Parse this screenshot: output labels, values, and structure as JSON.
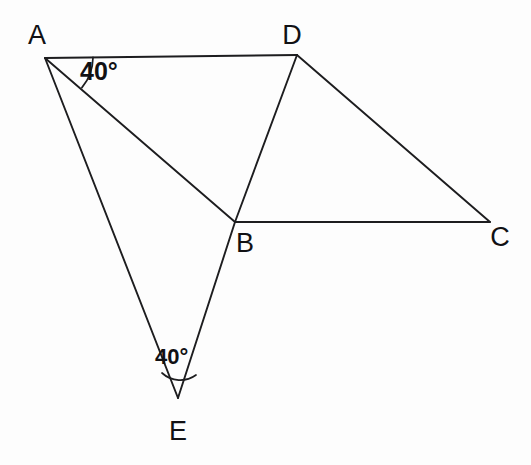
{
  "figure": {
    "background_color": "#fdfdfd",
    "stroke_color": "#1d1d1f",
    "vertices": [
      {
        "name": "A",
        "label": "A",
        "x": 45,
        "y": 58,
        "label_x": 37,
        "label_y": 44
      },
      {
        "name": "D",
        "label": "D",
        "x": 297,
        "y": 55,
        "label_x": 292,
        "label_y": 44
      },
      {
        "name": "B",
        "label": "B",
        "x": 235,
        "y": 222,
        "label_x": 245,
        "label_y": 252
      },
      {
        "name": "C",
        "label": "C",
        "x": 490,
        "y": 222,
        "label_x": 500,
        "label_y": 246
      },
      {
        "name": "E",
        "label": "E",
        "x": 178,
        "y": 398,
        "label_x": 178,
        "label_y": 440
      }
    ],
    "edges": [
      {
        "name": "segment-AD",
        "from": "A",
        "to": "D"
      },
      {
        "name": "segment-AB",
        "from": "A",
        "to": "B"
      },
      {
        "name": "segment-AE",
        "from": "A",
        "to": "E"
      },
      {
        "name": "segment-DB",
        "from": "D",
        "to": "B"
      },
      {
        "name": "segment-DC",
        "from": "D",
        "to": "C"
      },
      {
        "name": "segment-BC",
        "from": "B",
        "to": "C"
      },
      {
        "name": "segment-BE",
        "from": "B",
        "to": "E"
      }
    ],
    "angles": [
      {
        "name": "angle-at-A",
        "vertex": "A",
        "value": "40",
        "degree_symbol": "°",
        "text": "40°",
        "label_x": 80,
        "label_y": 80,
        "between": [
          "AD",
          "AB"
        ]
      },
      {
        "name": "angle-at-E",
        "vertex": "E",
        "value": "40",
        "degree_symbol": "°",
        "text": "40°",
        "label_x": 155,
        "label_y": 364,
        "between": [
          "EA",
          "EB"
        ]
      }
    ]
  }
}
